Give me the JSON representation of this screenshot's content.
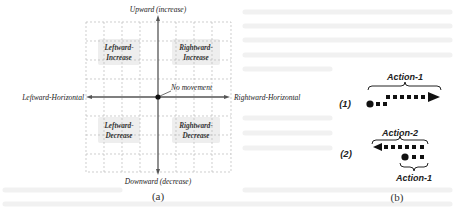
{
  "figure_a": {
    "caption": "(a)",
    "axes": {
      "top": "Upward (increase)",
      "bottom": "Downward (decrease)",
      "left": "Leftward-Horizontal",
      "right": "Rightward-Horizontal"
    },
    "origin_label": "No movement",
    "quadrants": {
      "top_left": [
        "Leftward-",
        "Increase"
      ],
      "top_right": [
        "Rightward-",
        "Increase"
      ],
      "bottom_left": [
        "Leftward-",
        "Decrease"
      ],
      "bottom_right": [
        "Rightward-",
        "Decrease"
      ]
    }
  },
  "figure_b": {
    "caption": "(b)",
    "rows": [
      {
        "index": "(1)",
        "labels": [
          "Action-1"
        ]
      },
      {
        "index": "(2)",
        "labels": [
          "Action-2",
          "Action-1"
        ]
      }
    ]
  },
  "colors": {
    "axis": "#555555",
    "grid": "#b9b9b9",
    "quadrant_fill": "#eeeeee",
    "marker": "#111111"
  }
}
